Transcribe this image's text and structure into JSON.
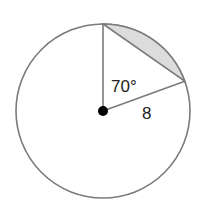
{
  "diagram": {
    "type": "circle-segment",
    "center": {
      "x": 103,
      "y": 111
    },
    "radius_px": 87,
    "angle_label": "70°",
    "radius_label": "8",
    "colors": {
      "stroke": "#7a7a7a",
      "shading": "#dcdcdc",
      "center_dot": "#000000"
    }
  }
}
